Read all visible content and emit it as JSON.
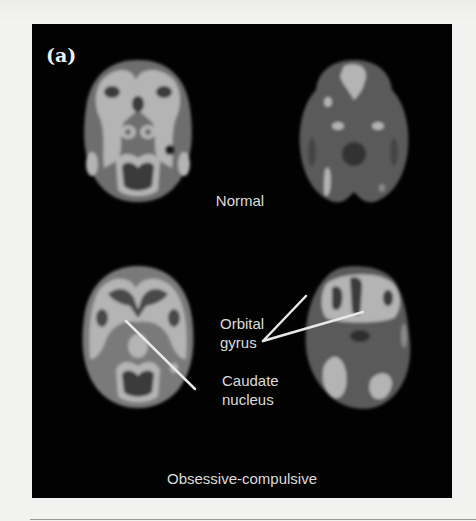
{
  "figure": {
    "panel_label": "(a)",
    "groups": [
      {
        "caption": "Normal",
        "scans": [
          "axial-pet-scan-left",
          "axial-pet-scan-right"
        ]
      },
      {
        "caption": "Obsessive-compulsive",
        "scans": [
          "axial-pet-scan-left",
          "axial-pet-scan-right"
        ]
      }
    ],
    "annotations": {
      "orbital_gyrus_line1": "Orbital",
      "orbital_gyrus_line2": "gyrus",
      "caudate_line1": "Caudate",
      "caudate_line2": "nucleus"
    },
    "colors": {
      "panel_background": "#020202",
      "page_background": "#f2f2f0",
      "label_text": "#dcdcdc",
      "pointer_line": "#e8e8e8",
      "scan_bright": "#b4b4b4",
      "scan_mid": "#6e6e6e",
      "scan_dark": "#3a3a3a"
    }
  }
}
